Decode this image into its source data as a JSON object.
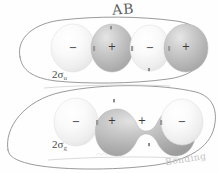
{
  "figure": {
    "title_annotation": "AB",
    "bottom_annotation": "Bonding",
    "background_color": "#fefefe",
    "width": 219,
    "height": 173
  },
  "rows": [
    {
      "id": "antibonding",
      "orbital_label": {
        "number": "2",
        "symbol": "σ",
        "subscript": "u",
        "full": "2σu"
      },
      "enclosure": "hand-drawn-rounded-outline",
      "lobes": [
        {
          "sign": "−",
          "shade": "light",
          "color": "#f2f2f2"
        },
        {
          "sign": "+",
          "shade": "dark",
          "color": "#bcbcbc"
        },
        {
          "sign": "−",
          "shade": "light",
          "color": "#f2f2f2"
        },
        {
          "sign": "+",
          "shade": "dark",
          "color": "#bcbcbc"
        }
      ],
      "merged": false
    },
    {
      "id": "bonding",
      "orbital_label": {
        "number": "2",
        "symbol": "σ",
        "subscript": "g",
        "full": "2σg"
      },
      "enclosure": "hand-drawn-ellipse-outline",
      "lobes": [
        {
          "sign": "−",
          "shade": "light",
          "color": "#f2f2f2"
        },
        {
          "sign": "+",
          "shade": "dark",
          "color": "#b4b4b4"
        },
        {
          "sign": "+",
          "shade": "dark",
          "color": "#b4b4b4"
        },
        {
          "sign": "−",
          "shade": "light",
          "color": "#f2f2f2"
        }
      ],
      "merged": true
    }
  ],
  "colors": {
    "outline_stroke": "#8c8c8c",
    "lobe_light": "#f4f4f4",
    "lobe_dark": "#b8b8b8",
    "sign_color": "#3a3a3a",
    "label_color": "#4a4a4a"
  }
}
